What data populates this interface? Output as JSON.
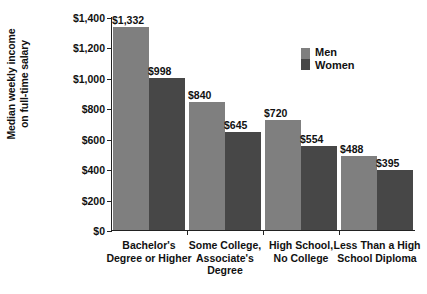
{
  "chart_data": {
    "type": "bar",
    "title": "",
    "xlabel": "",
    "ylabel_line1": "Median weekly income",
    "ylabel_line2": "on full-time salary",
    "ylim": [
      0,
      1400
    ],
    "grid": false,
    "legend_position": "top-right",
    "yticks": [
      {
        "value": 1400,
        "label": "$1,400"
      },
      {
        "value": 1200,
        "label": "$1,200"
      },
      {
        "value": 1000,
        "label": "$1,000"
      },
      {
        "value": 800,
        "label": "$800"
      },
      {
        "value": 600,
        "label": "$600"
      },
      {
        "value": 400,
        "label": "$400"
      },
      {
        "value": 200,
        "label": "$200"
      },
      {
        "value": 0,
        "label": "$0"
      }
    ],
    "categories": [
      "Bachelor's Degree or Higher",
      "Some College, Associate's Degree",
      "High School, No College",
      "Less Than a High School Diploma"
    ],
    "category_lines": [
      [
        "Bachelor's",
        "Degree or Higher"
      ],
      [
        "Some College,",
        "Associate's",
        "Degree"
      ],
      [
        "High School,",
        "No College"
      ],
      [
        "Less Than a High",
        "School Diploma"
      ]
    ],
    "series": [
      {
        "name": "Men",
        "color": "#7f7f7f",
        "values": [
          1332,
          840,
          720,
          488
        ],
        "labels": [
          "$1,332",
          "$840",
          "$720",
          "$488"
        ]
      },
      {
        "name": "Women",
        "color": "#474747",
        "values": [
          998,
          645,
          554,
          395
        ],
        "labels": [
          "$998",
          "$645",
          "$554",
          "$395"
        ]
      }
    ]
  },
  "legend": {
    "items": [
      {
        "label": "Men",
        "color": "#7f7f7f"
      },
      {
        "label": "Women",
        "color": "#474747"
      }
    ]
  }
}
